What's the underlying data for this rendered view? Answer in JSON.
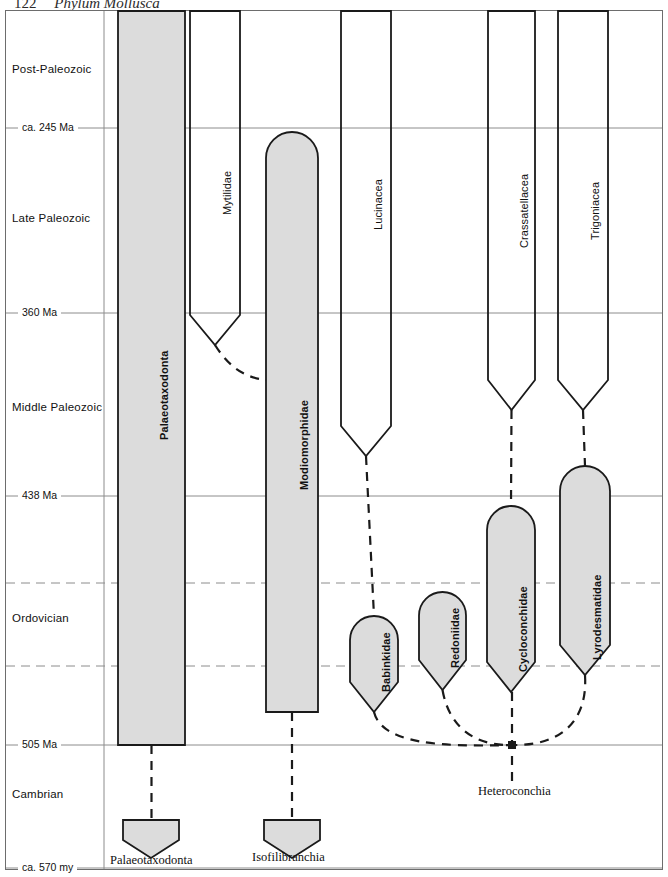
{
  "running_head": {
    "folio": "122",
    "title": "Phylum Mollusca"
  },
  "axis": {
    "eras": [
      {
        "name": "Post-Paleozoic",
        "y": 70
      },
      {
        "name": "Late Paleozoic",
        "y": 219
      },
      {
        "name": "Middle Paleozoic",
        "y": 408
      },
      {
        "name": "Ordovician",
        "y": 619
      },
      {
        "name": "Cambrian",
        "y": 795
      }
    ],
    "ticks": [
      {
        "label": "ca. 245 Ma",
        "y": 128
      },
      {
        "label": "360 Ma",
        "y": 313
      },
      {
        "label": "438 Ma",
        "y": 496
      },
      {
        "label": "505 Ma",
        "y": 745
      },
      {
        "label": "ca. 570 my",
        "y": 868
      }
    ],
    "dashed_gridlines_y": [
      583,
      666
    ]
  },
  "chart_data": {
    "type": "diagram",
    "ylabel": "Geologic time",
    "bars": [
      {
        "name": "Palaeotaxodonta",
        "x": 118,
        "width": 67,
        "top": 11,
        "bottom": 745,
        "top_shape": "flat",
        "bottom_shape": "flat"
      },
      {
        "name": "Mytilidae",
        "x": 190,
        "width": 50,
        "top": 11,
        "bottom": 345,
        "top_shape": "flat",
        "bottom_shape": "taper",
        "filled": false
      },
      {
        "name": "Modiomorphidae",
        "x": 266,
        "width": 52,
        "top": 132,
        "bottom": 712,
        "top_shape": "rounded",
        "bottom_shape": "flat"
      },
      {
        "name": "Lucinacea",
        "x": 341,
        "width": 50,
        "top": 11,
        "bottom": 456,
        "top_shape": "flat",
        "bottom_shape": "taper",
        "filled": false
      },
      {
        "name": "Crassatellacea",
        "x": 488,
        "width": 47,
        "top": 11,
        "bottom": 410,
        "top_shape": "flat",
        "bottom_shape": "taper",
        "filled": false
      },
      {
        "name": "Trigoniacea",
        "x": 558,
        "width": 50,
        "top": 11,
        "bottom": 410,
        "top_shape": "flat",
        "bottom_shape": "taper",
        "filled": false
      },
      {
        "name": "Babinkidae",
        "x": 350,
        "width": 48,
        "top": 616,
        "bottom": 712,
        "top_shape": "rounded",
        "bottom_shape": "taper"
      },
      {
        "name": "Redoniidae",
        "x": 419,
        "width": 47,
        "top": 592,
        "bottom": 690,
        "top_shape": "rounded",
        "bottom_shape": "taper"
      },
      {
        "name": "Cycloconchidae",
        "x": 487,
        "width": 48,
        "top": 506,
        "bottom": 692,
        "top_shape": "rounded",
        "bottom_shape": "taper"
      },
      {
        "name": "Lyrodesmatidae",
        "x": 560,
        "width": 50,
        "top": 466,
        "bottom": 675,
        "top_shape": "rounded",
        "bottom_shape": "taper"
      }
    ],
    "clade_shields": [
      {
        "name": "Palaeotaxodonta",
        "cx": 151,
        "top": 820,
        "label_x": 110,
        "label_y": 863
      },
      {
        "name": "Isofilibranchia",
        "cx": 292,
        "top": 820,
        "label_x": 252,
        "label_y": 860
      }
    ],
    "clade_labels": [
      {
        "name": "Heteroconchia",
        "x": 478,
        "y": 793
      }
    ],
    "connectors": [
      {
        "from": "Mytilidae-base",
        "to": "Modiomorphidae-side",
        "style": "dashed"
      },
      {
        "from": "Lucinacea-base",
        "to": "Babinkidae-top",
        "style": "dashed"
      },
      {
        "from": "Crassatellacea-base",
        "to": "Cycloconchidae-top",
        "style": "dashed"
      },
      {
        "from": "Trigoniacea-base",
        "to": "Lyrodesmatidae-top",
        "style": "dashed"
      },
      {
        "from": "Heteroconchia-node",
        "to": "Babinkidae-base",
        "style": "dashed-arc"
      },
      {
        "from": "Heteroconchia-node",
        "to": "Redoniidae-base",
        "style": "dashed-arc"
      },
      {
        "from": "Heteroconchia-node",
        "to": "Lyrodesmatidae-base",
        "style": "dashed-arc"
      },
      {
        "from": "Palaeotaxodonta-bar",
        "to": "Palaeotaxodonta-shield",
        "style": "dashed"
      },
      {
        "from": "Modiomorphidae-bar",
        "to": "Isofilibranchia-shield",
        "style": "dashed"
      }
    ]
  },
  "colors": {
    "bar_fill": "#dcdcdc",
    "bar_stroke": "#1a1a1a",
    "gridline": "#8c8c8c",
    "frame": "#6d6d6d",
    "text": "#111111"
  }
}
